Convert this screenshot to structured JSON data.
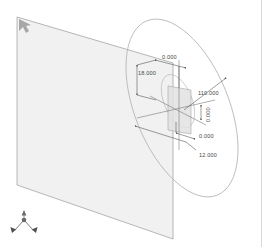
{
  "viewport": {
    "title": "CAD 3D Viewport",
    "background_color": "#ffffff",
    "border_color": "#d8d8d8",
    "width": 262,
    "height": 247
  },
  "geometry": {
    "datum_plane": {
      "name": "datum-plane",
      "fill_color": "#f1f1f1",
      "edge_color": "#9a9a9a",
      "points": "17,17 173,63 173,239 17,185"
    },
    "large_ellipse": {
      "name": "revolved-face-outline",
      "stroke_color": "#b5b5b5",
      "cx": 182,
      "cy": 108,
      "rx": 47,
      "ry": 94,
      "rotation": -22
    },
    "inner_ellipse": {
      "name": "inner-feature-outline",
      "stroke_color": "#bdbdbd",
      "cx": 178,
      "cy": 101,
      "rx": 14,
      "ry": 28,
      "rotation": -22
    },
    "feature_rect": {
      "name": "section-rectangle",
      "fill_color": "#e2e2e2",
      "edge_color": "#a6a6a6",
      "points": "168,86 191,90 191,134 168,130"
    }
  },
  "dimensions": [
    {
      "name": "dim-top-zero",
      "value": "0.000",
      "x": 162,
      "y": 62,
      "rotated": false
    },
    {
      "name": "dim-left-18",
      "value": "18.000",
      "x": 138,
      "y": 76,
      "rotated": false
    },
    {
      "name": "dim-right-110",
      "value": "110.000",
      "x": 198,
      "y": 94,
      "rotated": false
    },
    {
      "name": "dim-center-zero",
      "value": "0.000",
      "x": 205,
      "y": 122,
      "rotated": true
    },
    {
      "name": "dim-lower-zero",
      "value": "0.000",
      "x": 199,
      "y": 136,
      "rotated": false
    },
    {
      "name": "dim-lower-12",
      "value": "12.000",
      "x": 199,
      "y": 156,
      "rotated": false
    }
  ],
  "annotation_style": {
    "line_color": "#5a5a5a",
    "text_color": "#4a4a4a"
  },
  "axis_triad": {
    "name": "axis-triad",
    "color": "#5e5e5e",
    "origin_x": 24,
    "origin_y": 228
  },
  "corner_marker": {
    "name": "plane-corner-cursor",
    "color": "#8d8d8d",
    "x": 19,
    "y": 19
  }
}
